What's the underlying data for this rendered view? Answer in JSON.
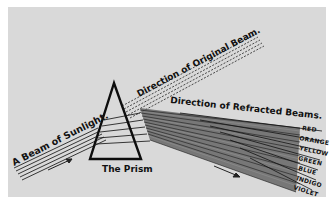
{
  "diagram": {
    "labels": {
      "incoming_beam": "A Beam of Sunlight.",
      "original_direction": "Direction of Original Beam.",
      "refracted_direction": "Direction of Refracted Beams.",
      "prism": "The Prism"
    },
    "spectrum": [
      "RED",
      "ORANGE",
      "YELLOW",
      "GREEN",
      "BLUE",
      "INDIGO",
      "VIOLET"
    ],
    "colors": {
      "paper": "#d9d9d9",
      "ink": "#111111",
      "border": "#ffffff"
    }
  }
}
